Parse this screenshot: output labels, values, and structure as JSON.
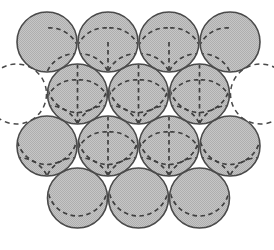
{
  "figure": {
    "title": "Close-packed spheres layer stacking diagram",
    "caption": "",
    "width": 274,
    "height": 250,
    "background_color": "#ffffff"
  },
  "style": {
    "sphere_fill": "#b9b9b9",
    "sphere_fill_dither_light": "#d2d2d2",
    "sphere_stroke": "#4a4a4a",
    "sphere_stroke_width": 1.6,
    "dashed_stroke": "#3f3f3f",
    "dashed_stroke_width": 1.7,
    "dash_pattern": "4.5 3.5",
    "ghost_stroke": "#4a4a4a",
    "ghost_stroke_width": 1.5,
    "ghost_dash_pattern": "5 4"
  },
  "geometry": {
    "radius": 30,
    "diameter": 60,
    "column_pitch": 61,
    "row_pitch": 52,
    "row_offset": 30.5,
    "origin_x": 47,
    "origin_y": 42
  },
  "chart_data": {
    "type": "scatter",
    "title": "Close-packed spheres layer stacking diagram",
    "xlabel": "",
    "ylabel": "",
    "xlim": [
      0,
      274
    ],
    "ylim": [
      0,
      250
    ],
    "grid": false,
    "legend": "none",
    "rows": [
      {
        "index": 0,
        "label": "row-1-top",
        "count": 4,
        "center_y": 42,
        "offset": 0,
        "pattern": "tripod",
        "pattern_rotation": 0,
        "centers_x": [
          47,
          108,
          169,
          230
        ]
      },
      {
        "index": 1,
        "label": "row-2",
        "count": 3,
        "center_y": 94,
        "offset": 30.5,
        "pattern": "star",
        "pattern_rotation": 0,
        "centers_x": [
          77.5,
          138.5,
          199.5
        ]
      },
      {
        "index": 2,
        "label": "row-3",
        "count": 4,
        "center_y": 146,
        "offset": 0,
        "pattern": "star",
        "pattern_rotation": 0,
        "centers_x": [
          47,
          108,
          169,
          230
        ]
      },
      {
        "index": 3,
        "label": "row-4-bottom",
        "count": 3,
        "center_y": 198,
        "offset": 30.5,
        "pattern": "cap",
        "pattern_rotation": 0,
        "centers_x": [
          77.5,
          138.5,
          199.5
        ]
      }
    ],
    "spheres": [
      {
        "id": "s-r1-c1",
        "cx": 47,
        "cy": 42,
        "r": 30,
        "row": 0,
        "col": 0,
        "pattern": "tripod"
      },
      {
        "id": "s-r1-c2",
        "cx": 108,
        "cy": 42,
        "r": 30,
        "row": 0,
        "col": 1,
        "pattern": "tripod"
      },
      {
        "id": "s-r1-c3",
        "cx": 169,
        "cy": 42,
        "r": 30,
        "row": 0,
        "col": 2,
        "pattern": "tripod"
      },
      {
        "id": "s-r1-c4",
        "cx": 230,
        "cy": 42,
        "r": 30,
        "row": 0,
        "col": 3,
        "pattern": "tripod"
      },
      {
        "id": "s-r2-c1",
        "cx": 77.5,
        "cy": 94,
        "r": 30,
        "row": 1,
        "col": 0,
        "pattern": "star"
      },
      {
        "id": "s-r2-c2",
        "cx": 138.5,
        "cy": 94,
        "r": 30,
        "row": 1,
        "col": 1,
        "pattern": "star"
      },
      {
        "id": "s-r2-c3",
        "cx": 199.5,
        "cy": 94,
        "r": 30,
        "row": 1,
        "col": 2,
        "pattern": "star"
      },
      {
        "id": "s-r3-c1",
        "cx": 47,
        "cy": 146,
        "r": 30,
        "row": 2,
        "col": 0,
        "pattern": "tripod"
      },
      {
        "id": "s-r3-c2",
        "cx": 108,
        "cy": 146,
        "r": 30,
        "row": 2,
        "col": 1,
        "pattern": "star"
      },
      {
        "id": "s-r3-c3",
        "cx": 169,
        "cy": 146,
        "r": 30,
        "row": 2,
        "col": 2,
        "pattern": "star"
      },
      {
        "id": "s-r3-c4",
        "cx": 230,
        "cy": 146,
        "r": 30,
        "row": 2,
        "col": 3,
        "pattern": "tripod"
      },
      {
        "id": "s-r4-c1",
        "cx": 77.5,
        "cy": 198,
        "r": 30,
        "row": 3,
        "col": 0,
        "pattern": "cap"
      },
      {
        "id": "s-r4-c2",
        "cx": 138.5,
        "cy": 198,
        "r": 30,
        "row": 3,
        "col": 1,
        "pattern": "cap"
      },
      {
        "id": "s-r4-c3",
        "cx": 199.5,
        "cy": 198,
        "r": 30,
        "row": 3,
        "col": 2,
        "pattern": "cap"
      }
    ],
    "ghost_circles": [
      {
        "id": "ghost-left",
        "cx": 16.5,
        "cy": 94,
        "r": 30,
        "label": "vacant-site-left"
      },
      {
        "id": "ghost-right",
        "cx": 260.5,
        "cy": 94,
        "r": 30,
        "label": "vacant-site-right"
      }
    ]
  }
}
